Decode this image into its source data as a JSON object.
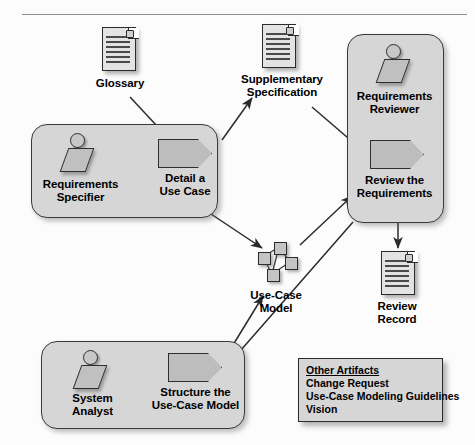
{
  "diagram": {
    "top_rule": true,
    "panels": [
      {
        "id": "requirements-specifier",
        "role_label": "Requirements\nSpecifier",
        "activity_label": "Detail a\nUse Case"
      },
      {
        "id": "requirements-reviewer",
        "role_label": "Requirements\nReviewer",
        "activity_label": "Review the\nRequirements"
      },
      {
        "id": "system-analyst",
        "role_label": "System\nAnalyst",
        "activity_label": "Structure the\nUse-Case Model"
      }
    ],
    "artifacts": [
      {
        "id": "glossary",
        "label": "Glossary",
        "icon": "document-icon"
      },
      {
        "id": "supplementary-specification",
        "label": "Supplementary\nSpecification",
        "icon": "document-icon"
      },
      {
        "id": "review-record",
        "label": "Review\nRecord",
        "icon": "document-icon"
      },
      {
        "id": "use-case-model",
        "label": "Use-Case\nModel",
        "icon": "use-case-model-icon"
      }
    ],
    "legend": {
      "header": "Other Artifacts",
      "items": [
        "Change Request",
        "Use-Case Modeling Guidelines",
        "Vision"
      ]
    },
    "colors": {
      "panel_fill": "#d6d6d6",
      "panel_border": "#3a3a3a",
      "icon_fill": "#c4c4c4",
      "icon_border": "#2b2b2b",
      "document_fill": "#e3e3e3",
      "connector": "#2b2b2b",
      "background": "#fcfcfc"
    },
    "connectors": [
      {
        "from": "glossary",
        "to": "detail-a-use-case",
        "arrow": "single"
      },
      {
        "from": "detail-a-use-case",
        "to": "supplementary-specification",
        "arrow": "single"
      },
      {
        "from": "supplementary-specification",
        "to": "review-the-requirements",
        "arrow": "single"
      },
      {
        "from": "detail-a-use-case",
        "to": "use-case-model",
        "arrow": "double"
      },
      {
        "from": "use-case-model",
        "to": "review-the-requirements",
        "arrow": "single"
      },
      {
        "from": "review-the-requirements",
        "to": "review-record",
        "arrow": "single"
      },
      {
        "from": "review-the-requirements",
        "to": "structure-the-use-case-model",
        "arrow": "single"
      },
      {
        "from": "structure-the-use-case-model",
        "to": "use-case-model",
        "arrow": "single"
      }
    ]
  }
}
